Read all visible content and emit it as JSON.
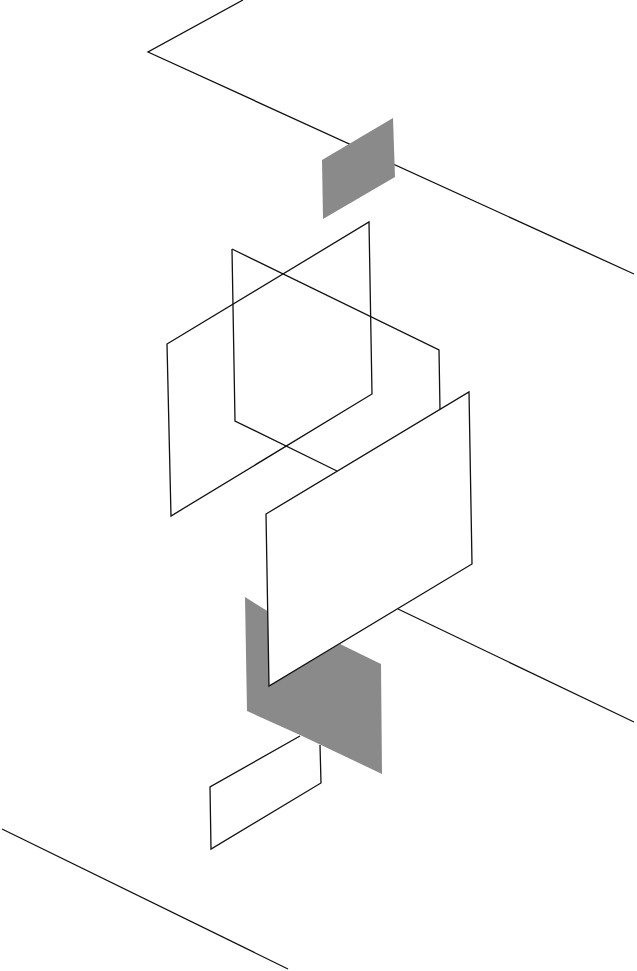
{
  "diagram": {
    "title": "",
    "style": "abstract isometric line composition",
    "colors": {
      "background": "#ffffff",
      "line": "#111111",
      "fill_gray": "#8a8a8a"
    },
    "elements": [
      {
        "id": "top-zigzag-line",
        "type": "polyline",
        "points": [
          [
            243,
            0
          ],
          [
            148,
            52
          ],
          [
            634,
            274
          ]
        ]
      },
      {
        "id": "top-gray-plane",
        "type": "polygon",
        "fill": "gray",
        "points": [
          [
            322,
            160
          ],
          [
            393,
            118
          ],
          [
            395,
            177
          ],
          [
            323,
            219
          ]
        ]
      },
      {
        "id": "middle-plane",
        "type": "polyline",
        "points": [
          [
            232,
            249
          ],
          [
            439,
            350
          ],
          [
            440,
            410
          ]
        ]
      },
      {
        "id": "middle-plane-lower",
        "type": "polyline",
        "points": [
          [
            232,
            249
          ],
          [
            235,
            421
          ],
          [
            337,
            471
          ]
        ]
      },
      {
        "id": "left-plane",
        "type": "polygon",
        "points": [
          [
            167,
            344
          ],
          [
            369,
            222
          ],
          [
            372,
            394
          ],
          [
            171,
            516
          ]
        ]
      },
      {
        "id": "bottom-gray-plane",
        "type": "polygon",
        "fill": "gray",
        "points": [
          [
            245,
            597
          ],
          [
            269,
            612
          ],
          [
            269,
            686
          ],
          [
            340,
            644
          ],
          [
            381,
            664
          ],
          [
            382,
            774
          ],
          [
            300,
            735
          ],
          [
            247,
            711
          ]
        ]
      },
      {
        "id": "front-plane",
        "type": "polygon",
        "fill": "white",
        "points": [
          [
            266,
            514
          ],
          [
            469,
            392
          ],
          [
            472,
            564
          ],
          [
            269,
            686
          ]
        ]
      },
      {
        "id": "right-diagonal-line",
        "type": "polyline",
        "points": [
          [
            398,
            609
          ],
          [
            634,
            722
          ]
        ]
      },
      {
        "id": "small-box",
        "type": "polyline",
        "points": [
          [
            300,
            736
          ],
          [
            210,
            787
          ],
          [
            211,
            849
          ],
          [
            321,
            783
          ],
          [
            320,
            745
          ]
        ]
      },
      {
        "id": "bottom-diagonal-line",
        "type": "polyline",
        "points": [
          [
            2,
            829
          ],
          [
            288,
            969
          ]
        ]
      }
    ]
  }
}
